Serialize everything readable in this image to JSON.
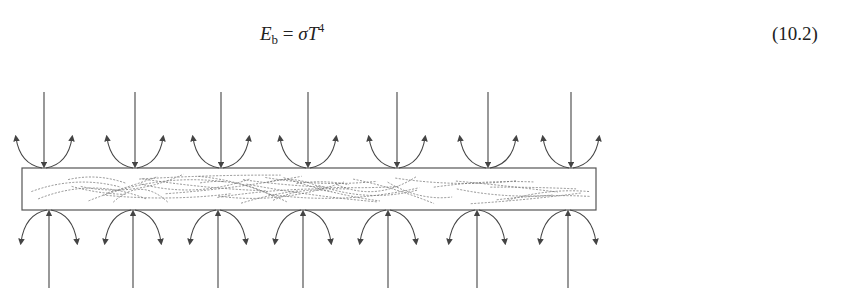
{
  "equation": {
    "lhs_symbol": "E",
    "lhs_subscript": "b",
    "operator": "=",
    "rhs_symbol_sigma": "σ",
    "rhs_symbol_T": "T",
    "rhs_exponent": "4",
    "number": "(10.2)"
  },
  "figure": {
    "slab": {
      "x": 22,
      "y": 168,
      "width": 574,
      "height": 42,
      "stroke": "#555555"
    },
    "top_arrows_x": [
      44,
      135,
      221,
      308,
      397,
      488,
      571
    ],
    "bottom_arrows_x": [
      49,
      133,
      218,
      303,
      388,
      477,
      568
    ],
    "line_color": "#444444"
  }
}
